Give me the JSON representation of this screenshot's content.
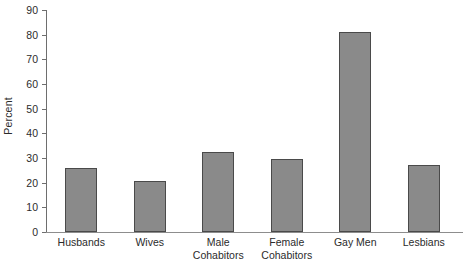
{
  "chart_data": {
    "type": "bar",
    "title": "",
    "xlabel": "",
    "ylabel": "Percent",
    "ylim": [
      0,
      90
    ],
    "yticks": [
      0,
      10,
      20,
      30,
      40,
      50,
      60,
      70,
      80,
      90
    ],
    "ytick_labels": [
      "0",
      "10",
      "20",
      "30",
      "40",
      "50",
      "60",
      "70",
      "80",
      "90"
    ],
    "grid": false,
    "legend": null,
    "categories": [
      "Husbands",
      "Wives",
      "Male Cohabitors",
      "Female Cohabitors",
      "Gay Men",
      "Lesbians"
    ],
    "category_lines": [
      [
        "Husbands",
        ""
      ],
      [
        "Wives",
        ""
      ],
      [
        "Male",
        "Cohabitors"
      ],
      [
        "Female",
        "Cohabitors"
      ],
      [
        "Gay Men",
        ""
      ],
      [
        "Lesbians",
        ""
      ]
    ],
    "values": [
      26,
      20.5,
      32.5,
      29.5,
      81,
      27
    ],
    "bar_color": "#8a8a8a",
    "bar_edge_color": "#4a4a4a",
    "axis_color": "#6e6e6e",
    "baseline_color": "#8d8d8d",
    "text_color": "#2b2b2b",
    "background": "#ffffff"
  }
}
